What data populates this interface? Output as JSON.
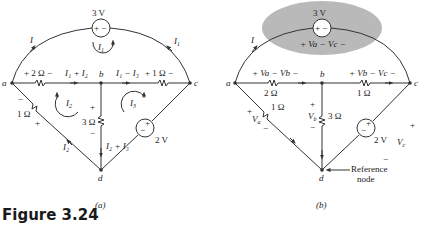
{
  "figure": {
    "title": "Figure 3.24",
    "panels": [
      {
        "id": "a",
        "caption": "(a)",
        "nodes": [
          "a",
          "b",
          "c",
          "d"
        ],
        "source_top": {
          "value": "3 V",
          "polarity": "+ −"
        },
        "source_right": {
          "value": "2 V",
          "polarity_plus": "+",
          "polarity_minus": "−"
        },
        "resistors": {
          "r_ab": {
            "value": "2 Ω",
            "label": "+ 2 Ω −"
          },
          "r_bc": {
            "value": "1 Ω",
            "label": "+ 1 Ω −"
          },
          "r_ad": {
            "value": "1 Ω"
          },
          "r_bd": {
            "value": "3 Ω"
          }
        },
        "currents": {
          "I": "I",
          "I1_top": "I",
          "I1_top_sub": "1",
          "I1_loop": "I",
          "I1_loop_sub": "1",
          "I2_loop": "I",
          "I2_loop_sub": "2",
          "I3_loop": "I",
          "I3_loop_sub": "3",
          "ab_branch": "I₁ + I₂",
          "bc_branch": "I₁ − I₃",
          "bd_branch": "I₂ + I₃",
          "ad_branch": "I₂"
        },
        "signs": {
          "plus": "+",
          "minus": "−"
        }
      },
      {
        "id": "b",
        "caption": "(b)",
        "nodes": [
          "a",
          "b",
          "c",
          "d"
        ],
        "source_top": {
          "value": "3 V",
          "polarity": "+ −",
          "voltage_label": "+ Va − Vc −"
        },
        "source_right": {
          "value": "2 V",
          "polarity_plus": "+",
          "polarity_minus": "−"
        },
        "resistors": {
          "r_ab": {
            "value": "2 Ω",
            "voltage_label": "+ Va − Vb −"
          },
          "r_bc": {
            "value": "1 Ω",
            "voltage_label": "+ Vb − Vc −"
          },
          "r_ad": {
            "value": "1 Ω"
          },
          "r_bd": {
            "value": "3 Ω"
          }
        },
        "voltages": {
          "Va": "V",
          "Va_sub": "a",
          "Vb": "V",
          "Vb_sub": "b",
          "Vc": "V",
          "Vc_sub": "c"
        },
        "current_I": "I",
        "reference_note": {
          "line1": "Reference",
          "line2": "node"
        },
        "signs": {
          "plus": "+",
          "minus": "−"
        }
      }
    ]
  },
  "colors": {
    "wire": "#333333",
    "highlight": "#b9b9b9",
    "text": "#222222",
    "title": "#1a1a1a"
  }
}
